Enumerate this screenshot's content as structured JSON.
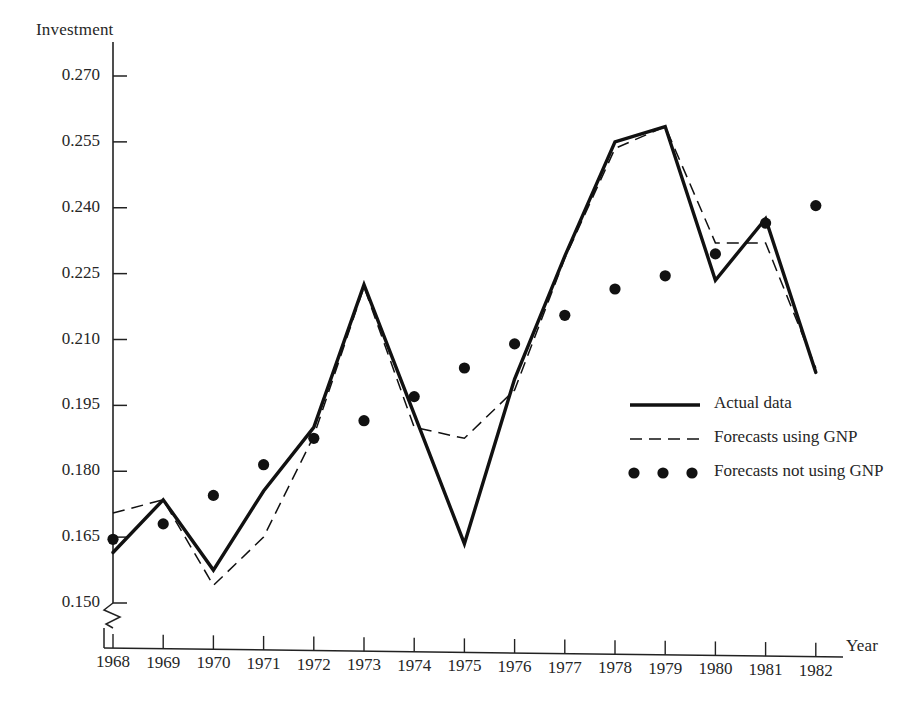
{
  "chart_data": {
    "type": "line",
    "title": "",
    "ylabel": "Investment",
    "xlabel": "Year",
    "grid": false,
    "legend_position": "center-right",
    "axis_break": true,
    "axis_break_note": "y-axis broken below 0.150",
    "ylim": [
      0.15,
      0.27
    ],
    "yticks": [
      "0.150",
      "0.165",
      "0.180",
      "0.195",
      "0.210",
      "0.225",
      "0.240",
      "0.255",
      "0.270"
    ],
    "ytick_values": [
      0.15,
      0.165,
      0.18,
      0.195,
      0.21,
      0.225,
      0.24,
      0.255,
      0.27
    ],
    "categories": [
      "1968",
      "1969",
      "1970",
      "1971",
      "1972",
      "1973",
      "1974",
      "1975",
      "1976",
      "1977",
      "1978",
      "1979",
      "1980",
      "1981",
      "1982"
    ],
    "x": [
      1968,
      1969,
      1970,
      1971,
      1972,
      1973,
      1974,
      1975,
      1976,
      1977,
      1978,
      1979,
      1980,
      1981,
      1982
    ],
    "series": [
      {
        "name": "Actual data",
        "style": "solid",
        "color": "#111111",
        "values": [
          0.1615,
          0.1735,
          0.1575,
          0.1755,
          0.19,
          0.2225,
          0.193,
          0.1635,
          0.201,
          0.229,
          0.255,
          0.2585,
          0.2235,
          0.2375,
          0.2025
        ]
      },
      {
        "name": "Forecasts using GNP",
        "style": "dashed",
        "color": "#111111",
        "values": [
          0.1705,
          0.1735,
          0.154,
          0.165,
          0.188,
          0.222,
          0.19,
          0.1875,
          0.1985,
          0.2285,
          0.2535,
          0.2585,
          0.232,
          0.232,
          0.2035
        ]
      },
      {
        "name": "Forecasts not using GNP",
        "style": "dots",
        "color": "#111111",
        "values": [
          0.1645,
          0.168,
          0.1745,
          0.1815,
          0.1875,
          0.1915,
          0.197,
          0.2035,
          0.209,
          0.2155,
          0.2215,
          0.2245,
          0.2295,
          0.2365,
          0.2405
        ]
      }
    ]
  },
  "axes": {
    "y_title": "Investment",
    "x_title": "Year"
  },
  "legend": {
    "items": [
      {
        "label": "Actual data",
        "marker": "solid-line"
      },
      {
        "label": "Forecasts using GNP",
        "marker": "dashed-line"
      },
      {
        "label": "Forecasts not using GNP",
        "marker": "dot-row"
      }
    ]
  }
}
